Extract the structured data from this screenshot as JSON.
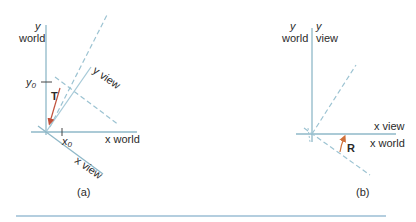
{
  "colors": {
    "axis": "#8fb8c8",
    "dashed": "#9cc3d2",
    "arrow": "#c0503a",
    "rule": "#6a9ec0",
    "text": "#2a2a2a"
  },
  "panel_a": {
    "caption": "(a)",
    "y_world_label_var": "y",
    "y_world_label_word": "world",
    "x_world_label": "x world",
    "y_view_label": "y view",
    "x_view_label": "x view",
    "y0_label": "y",
    "y0_sub": "0",
    "x0_label": "x",
    "x0_sub": "0",
    "translation_label": "T"
  },
  "panel_b": {
    "caption": "(b)",
    "y_world_label_var": "y",
    "y_world_label_word": "world",
    "y_view_label_var": "y",
    "y_view_label_word": "view",
    "x_view_label": "x view",
    "x_world_label": "x world",
    "rotation_label": "R"
  }
}
